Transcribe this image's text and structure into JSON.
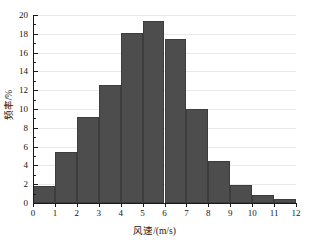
{
  "chart_data": {
    "type": "bar",
    "title": "",
    "subtitle": "",
    "xlabel": "风速/(m/s)",
    "ylabel": "频率/%",
    "xlim": [
      0,
      12
    ],
    "ylim": [
      0,
      20
    ],
    "grid": "horizontal",
    "legend": "none",
    "bar_color": "#4d4d4d",
    "grid_color": "#e8e8e8",
    "axis_color": "#1a1a1a",
    "x_tick_labels": [
      "0",
      "1",
      "2",
      "3",
      "4",
      "5",
      "6",
      "7",
      "8",
      "9",
      "10",
      "11",
      "12"
    ],
    "x_tick_values": [
      0,
      1,
      2,
      3,
      4,
      5,
      6,
      7,
      8,
      9,
      10,
      11,
      12
    ],
    "y_tick_labels": [
      "0",
      "2",
      "4",
      "6",
      "8",
      "10",
      "12",
      "14",
      "16",
      "18",
      "20"
    ],
    "y_tick_values": [
      0,
      2,
      4,
      6,
      8,
      10,
      12,
      14,
      16,
      18,
      20
    ],
    "y_minor_tick_values": [
      1,
      3,
      5,
      7,
      9,
      11,
      13,
      15,
      17,
      19
    ],
    "bin_edges": [
      0,
      1,
      2,
      3,
      4,
      5,
      6,
      7,
      8,
      9,
      10,
      11,
      12
    ],
    "categories": [
      "0-1",
      "1-2",
      "2-3",
      "3-4",
      "4-5",
      "5-6",
      "6-7",
      "7-8",
      "8-9",
      "9-10",
      "10-11",
      "11-12"
    ],
    "values": [
      1.8,
      5.4,
      9.2,
      12.6,
      18.1,
      19.4,
      17.4,
      10.0,
      4.5,
      1.9,
      0.8,
      0.4
    ]
  }
}
